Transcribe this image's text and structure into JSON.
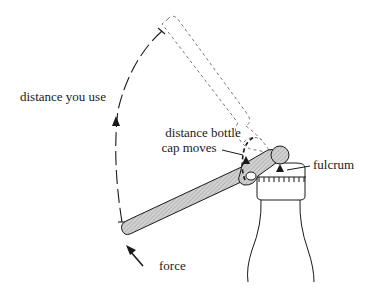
{
  "diagram": {
    "type": "lever-bottle-opener",
    "labels": {
      "distance_you_use": "distance you use",
      "distance_cap_line1": "distance bottle",
      "distance_cap_line2": "cap moves",
      "fulcrum": "fulcrum",
      "force": "force"
    },
    "colors": {
      "ink": "#1a1a1a",
      "lever_fill": "#c8c8c8",
      "ghost": "#777777",
      "background": "#ffffff"
    }
  }
}
